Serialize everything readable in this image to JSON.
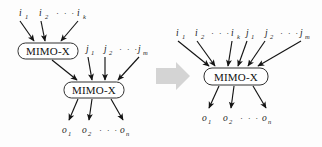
{
  "figure": {
    "background_color": "#fdfdfd",
    "ink_color": "#141414",
    "transform_arrow_color": "#d4d4d4"
  },
  "left_diagram": {
    "name": "two-stage-cascade",
    "blocks": [
      {
        "id": "block-1",
        "label": "MIMO-X"
      },
      {
        "id": "block-2",
        "label": "MIMO-X"
      }
    ],
    "inputs_top": [
      {
        "base": "i",
        "sub": "1"
      },
      {
        "base": "i",
        "sub": "2"
      },
      {
        "base": "i",
        "sub": "k"
      }
    ],
    "inputs_mid": [
      {
        "base": "j",
        "sub": "1"
      },
      {
        "base": "j",
        "sub": "2"
      },
      {
        "base": "j",
        "sub": "m"
      }
    ],
    "outputs": [
      {
        "base": "o",
        "sub": "1"
      },
      {
        "base": "o",
        "sub": "2"
      },
      {
        "base": "o",
        "sub": "n"
      }
    ],
    "ellipsis": "· · ·"
  },
  "transform": {
    "name": "rightwards-block-arrow",
    "direction": "right"
  },
  "right_diagram": {
    "name": "single-merged-block",
    "blocks": [
      {
        "id": "block-merged",
        "label": "MIMO-X"
      }
    ],
    "inputs": [
      {
        "base": "i",
        "sub": "1"
      },
      {
        "base": "i",
        "sub": "2"
      },
      {
        "base": "i",
        "sub": "k"
      },
      {
        "base": "j",
        "sub": "1"
      },
      {
        "base": "j",
        "sub": "2"
      },
      {
        "base": "j",
        "sub": "m"
      }
    ],
    "outputs": [
      {
        "base": "o",
        "sub": "1"
      },
      {
        "base": "o",
        "sub": "2"
      },
      {
        "base": "o",
        "sub": "n"
      }
    ],
    "ellipsis": "· · ·"
  }
}
